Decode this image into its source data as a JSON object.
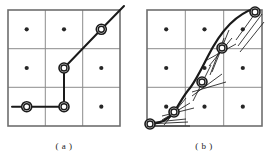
{
  "figure": {
    "type": "diagram",
    "background_color": "#ffffff",
    "stroke_color": "#1a1a1a",
    "grid_color": "#8c8c8c",
    "dot_color": "#262626"
  },
  "panels": [
    {
      "id": "a",
      "caption": "( a )",
      "grid": {
        "x": 8,
        "y": 10,
        "width": 112,
        "height": 116,
        "rows": 3,
        "cols": 3,
        "border_width": 1.6,
        "line_width": 1.0
      },
      "cell_dots": [
        {
          "cx": 26.7,
          "cy": 29.3
        },
        {
          "cx": 64.0,
          "cy": 29.3
        },
        {
          "cx": 101.3,
          "cy": 29.3
        },
        {
          "cx": 26.7,
          "cy": 68.0
        },
        {
          "cx": 64.0,
          "cy": 68.0
        },
        {
          "cx": 101.3,
          "cy": 68.0
        },
        {
          "cx": 26.7,
          "cy": 106.7
        },
        {
          "cx": 64.0,
          "cy": 106.7
        },
        {
          "cx": 101.3,
          "cy": 106.7
        }
      ],
      "dot_radius": 2.1,
      "path_points": [
        {
          "x": 12.0,
          "y": 106.7
        },
        {
          "x": 26.7,
          "y": 106.7
        },
        {
          "x": 64.0,
          "y": 106.7
        },
        {
          "x": 64.0,
          "y": 68.0
        },
        {
          "x": 101.3,
          "y": 29.3
        },
        {
          "x": 124.0,
          "y": 6.0
        }
      ],
      "path_width": 2.0,
      "nodes": [
        {
          "cx": 26.7,
          "cy": 106.7
        },
        {
          "cx": 64.0,
          "cy": 106.7
        },
        {
          "cx": 64.0,
          "cy": 68.0
        },
        {
          "cx": 101.3,
          "cy": 29.3
        }
      ],
      "node_outer_radius": 5.0,
      "node_inner_radius": 3.0
    },
    {
      "id": "b",
      "caption": "( b )",
      "grid": {
        "x": 147,
        "y": 10,
        "width": 115,
        "height": 116,
        "rows": 3,
        "cols": 3,
        "border_width": 1.6,
        "line_width": 1.0
      },
      "cell_dots": [
        {
          "cx": 166.2,
          "cy": 29.3
        },
        {
          "cx": 204.5,
          "cy": 29.3
        },
        {
          "cx": 242.8,
          "cy": 29.3
        },
        {
          "cx": 166.2,
          "cy": 68.0
        },
        {
          "cx": 204.5,
          "cy": 68.0
        },
        {
          "cx": 242.8,
          "cy": 68.0
        },
        {
          "cx": 166.2,
          "cy": 106.7
        },
        {
          "cx": 204.5,
          "cy": 106.7
        },
        {
          "cx": 242.8,
          "cy": 106.7
        }
      ],
      "dot_radius": 2.1,
      "curve": "M 150 124 C 160 123.5 168 120 174 112 C 179 105 183 96 190 88 C 196 80 201 70 207 58 C 213 46 220 34 230 24 C 238 16 246 11 256 8",
      "curve_width": 2.2,
      "nodes": [
        {
          "cx": 150.0,
          "cy": 124.0
        },
        {
          "cx": 174.0,
          "cy": 112.0
        },
        {
          "cx": 202.0,
          "cy": 82.0
        },
        {
          "cx": 222.0,
          "cy": 48.0
        },
        {
          "cx": 255.0,
          "cy": 12.0
        }
      ],
      "node_outer_radius": 5.0,
      "node_inner_radius": 3.0,
      "tangent_fans": [
        {
          "cx": 150.0,
          "cy": 124.0,
          "lines": [
            {
              "x1": 146,
              "y1": 126,
              "x2": 190,
              "y2": 126
            },
            {
              "x1": 146,
              "y1": 124,
              "x2": 188,
              "y2": 122
            },
            {
              "x1": 146,
              "y1": 123,
              "x2": 186,
              "y2": 119
            }
          ]
        },
        {
          "cx": 174.0,
          "cy": 112.0,
          "lines": [
            {
              "x1": 164,
              "y1": 125,
              "x2": 186,
              "y2": 98
            },
            {
              "x1": 162,
              "y1": 120,
              "x2": 190,
              "y2": 103
            },
            {
              "x1": 162,
              "y1": 116,
              "x2": 194,
              "y2": 108
            }
          ]
        },
        {
          "cx": 202.0,
          "cy": 82.0,
          "lines": [
            {
              "x1": 193,
              "y1": 101,
              "x2": 211,
              "y2": 65
            },
            {
              "x1": 192,
              "y1": 96,
              "x2": 222,
              "y2": 74
            },
            {
              "x1": 192,
              "y1": 92,
              "x2": 226,
              "y2": 82
            }
          ]
        },
        {
          "cx": 222.0,
          "cy": 48.0,
          "lines": [
            {
              "x1": 212,
              "y1": 72,
              "x2": 229,
              "y2": 30
            },
            {
              "x1": 209,
              "y1": 66,
              "x2": 232,
              "y2": 38
            },
            {
              "x1": 207,
              "y1": 60,
              "x2": 236,
              "y2": 44
            },
            {
              "x1": 210,
              "y1": 75,
              "x2": 224,
              "y2": 38
            }
          ]
        },
        {
          "cx": 255.0,
          "cy": 12.0,
          "lines": [
            {
              "x1": 236,
              "y1": 40,
              "x2": 259,
              "y2": 8
            },
            {
              "x1": 238,
              "y1": 46,
              "x2": 262,
              "y2": 14
            },
            {
              "x1": 240,
              "y1": 52,
              "x2": 264,
              "y2": 22
            }
          ]
        }
      ]
    }
  ],
  "captions": {
    "a": "( a )",
    "b": "( b )"
  }
}
